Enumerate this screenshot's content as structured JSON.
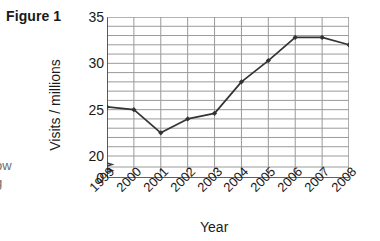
{
  "figure": {
    "label": "Figure 1"
  },
  "margin_fragments": {
    "fragment_1": "i",
    "fragment_2": "ow",
    "fragment_3": "g"
  },
  "chart_data": {
    "type": "line",
    "title": "",
    "xlabel": "Year",
    "ylabel": "Visits / millions",
    "categories": [
      "1999",
      "2000",
      "2001",
      "2002",
      "2003",
      "2004",
      "2005",
      "2006",
      "2007",
      "2008"
    ],
    "values": [
      25.3,
      25.0,
      22.5,
      24.0,
      24.6,
      28.0,
      30.3,
      32.8,
      32.8,
      32.0
    ],
    "series": [
      {
        "name": "Visits",
        "values": [
          25.3,
          25.0,
          22.5,
          24.0,
          24.6,
          28.0,
          30.3,
          32.8,
          32.8,
          32.0
        ]
      }
    ],
    "ylim": [
      20,
      35
    ],
    "y_major_ticks": [
      "0",
      "20",
      "25",
      "30",
      "35"
    ],
    "y_minor_step": 1,
    "x_tick_labels": [
      "1999",
      "2000",
      "2001",
      "2002",
      "2003",
      "2004",
      "2005",
      "2006",
      "2007",
      "2008"
    ],
    "grid": true,
    "axis_break": true,
    "axis_break_between": [
      0,
      20
    ],
    "legend": "none",
    "line_color": "#333333",
    "grid_color": "#9a9a9a",
    "axis_color": "#3d3d3d",
    "marker": "diamond"
  }
}
